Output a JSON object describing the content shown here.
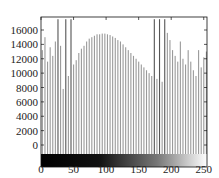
{
  "chart_data": {
    "type": "bar",
    "title": "",
    "xlabel": "",
    "ylabel": "",
    "xlim": [
      0,
      255
    ],
    "ylim": [
      -1200,
      17500
    ],
    "grid": false,
    "legend": null,
    "x_ticks": [
      0,
      50,
      100,
      150,
      200,
      250
    ],
    "y_ticks": [
      0,
      2000,
      4000,
      6000,
      8000,
      10000,
      12000,
      14000,
      16000
    ],
    "x_tick_labels": [
      "0",
      "50",
      "100",
      "150",
      "200",
      "250"
    ],
    "y_tick_labels": [
      "0",
      "2000",
      "4000",
      "6000",
      "8000",
      "10000",
      "12000",
      "14000",
      "16000"
    ],
    "colorbar": "grayscale gradient black (0) to white (255) along x-axis",
    "bar_color": "#9a9a9a",
    "x": [
      2,
      6,
      10,
      14,
      18,
      22,
      26,
      30,
      34,
      38,
      42,
      46,
      50,
      54,
      58,
      62,
      66,
      70,
      74,
      78,
      82,
      86,
      90,
      94,
      98,
      102,
      106,
      110,
      114,
      118,
      122,
      126,
      130,
      134,
      138,
      142,
      146,
      150,
      154,
      158,
      162,
      166,
      170,
      174,
      178,
      182,
      186,
      190,
      194,
      198,
      202,
      206,
      210,
      214,
      218,
      222,
      226,
      230,
      234,
      238,
      242,
      246,
      250,
      254
    ],
    "values": [
      13200,
      15000,
      11600,
      13600,
      12400,
      14400,
      17500,
      13800,
      7800,
      17500,
      9600,
      17500,
      11200,
      11800,
      12800,
      13400,
      13800,
      14400,
      14800,
      15000,
      15200,
      15400,
      15400,
      15500,
      15500,
      15400,
      15300,
      15100,
      14900,
      14600,
      14400,
      14000,
      13600,
      13200,
      12800,
      12400,
      12000,
      11600,
      11200,
      10800,
      10400,
      10000,
      9600,
      17500,
      9200,
      17500,
      8800,
      17500,
      15600,
      14600,
      13200,
      12400,
      11600,
      14400,
      12000,
      11200,
      13200,
      11600,
      10400,
      9600,
      13200,
      10800,
      12200,
      13000
    ]
  }
}
